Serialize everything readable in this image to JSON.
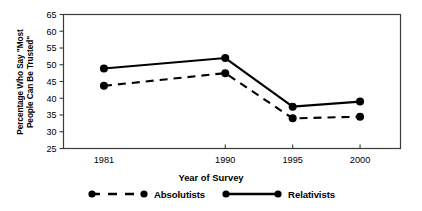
{
  "chart_data": {
    "type": "line",
    "title": "",
    "xlabel": "Year of Survey",
    "ylabel": "Percentage Who Say \"Most\nPeople Can Be Trusted\"",
    "categories": [
      "1981",
      "1990",
      "1995",
      "2000"
    ],
    "x": [
      1981,
      1990,
      1995,
      2000
    ],
    "xlim": [
      1978,
      2003
    ],
    "ylim": [
      25,
      65
    ],
    "yticks": [
      25,
      30,
      35,
      40,
      45,
      50,
      55,
      60,
      65
    ],
    "ytick_labels": [
      "25",
      "30",
      "35",
      "40",
      "45",
      "50",
      "55",
      "60",
      "65"
    ],
    "grid": false,
    "legend_position": "below",
    "series": [
      {
        "name": "Absolutists",
        "values": [
          43.7,
          47.5,
          34.0,
          34.5
        ],
        "line_style": "dashed",
        "marker": "circle",
        "color": "#000000"
      },
      {
        "name": "Relativists",
        "values": [
          48.9,
          52.0,
          37.5,
          39.0
        ],
        "line_style": "solid",
        "marker": "circle",
        "color": "#000000"
      }
    ]
  },
  "axes": {
    "y_label_text": "Percentage Who Say \"Most\nPeople Can Be Trusted\"",
    "x_label_text": "Year of Survey"
  },
  "legend": {
    "items": [
      {
        "label": "Absolutists",
        "style": "dashed"
      },
      {
        "label": "Relativists",
        "style": "solid"
      }
    ]
  },
  "colors": {
    "ink": "#000000",
    "axis": "#3a3a3a",
    "background": "#ffffff"
  }
}
